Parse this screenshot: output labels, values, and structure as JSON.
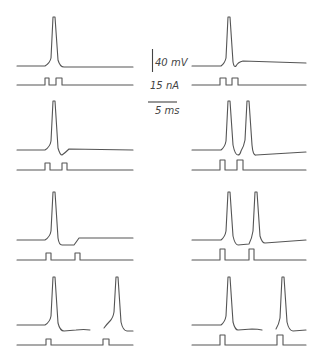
{
  "figure": {
    "scale_bars": {
      "voltage": "40 mV",
      "current": "15 nA",
      "time": "5 ms"
    },
    "colors": {
      "trace": "#555555",
      "background": "#ffffff"
    },
    "panels": [
      {
        "id": "left-1",
        "column": "left",
        "row": 1,
        "spikes": 1,
        "stim_pulses": 2,
        "interval": "short"
      },
      {
        "id": "right-1",
        "column": "right",
        "row": 1,
        "spikes": 1,
        "stim_pulses": 2,
        "interval": "short"
      },
      {
        "id": "left-2",
        "column": "left",
        "row": 2,
        "spikes": 1,
        "stim_pulses": 2,
        "interval": "medium"
      },
      {
        "id": "right-2",
        "column": "right",
        "row": 2,
        "spikes": 2,
        "stim_pulses": 2,
        "interval": "medium"
      },
      {
        "id": "left-3",
        "column": "left",
        "row": 3,
        "spikes": 1,
        "stim_pulses": 2,
        "interval": "longer"
      },
      {
        "id": "right-3",
        "column": "right",
        "row": 3,
        "spikes": 2,
        "stim_pulses": 2,
        "interval": "longer"
      },
      {
        "id": "left-4",
        "column": "left",
        "row": 4,
        "spikes": 2,
        "stim_pulses": 2,
        "interval": "longest"
      },
      {
        "id": "right-4",
        "column": "right",
        "row": 4,
        "spikes": 2,
        "stim_pulses": 2,
        "interval": "longest"
      }
    ]
  }
}
